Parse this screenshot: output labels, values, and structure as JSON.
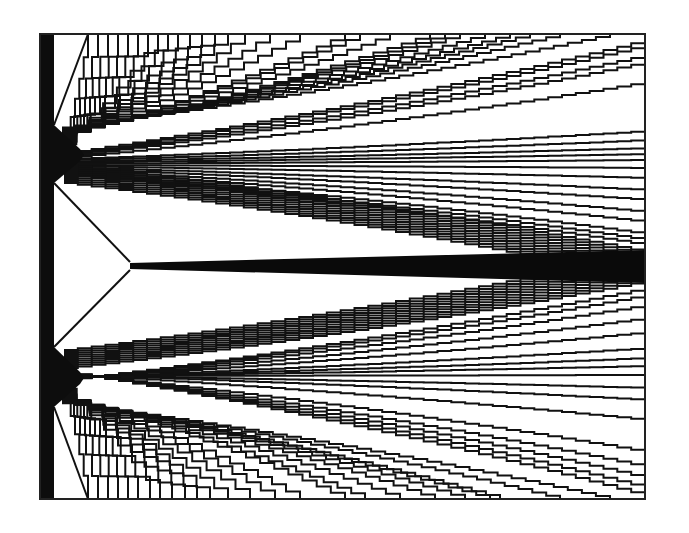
{
  "figure": {
    "type": "streamline-diagram",
    "frame": {
      "x0": 40,
      "y0": 34,
      "x1": 645,
      "y1": 499
    },
    "left_boundary": {
      "x": 40,
      "width": 14,
      "color": "#0d0d0d"
    },
    "line_color": "#111111",
    "background": "#ffffff",
    "sources": [
      {
        "name": "upper",
        "x": 54,
        "y": 155,
        "spread": [
          125,
          183
        ]
      },
      {
        "name": "lower",
        "x": 54,
        "y": 378,
        "spread": [
          347,
          407
        ]
      }
    ],
    "central_band": {
      "start": [
        130,
        266
      ],
      "end_top": [
        645,
        250
      ],
      "end_bottom": [
        645,
        283
      ]
    },
    "upper_top_exits_x": [
      88,
      98,
      108,
      118,
      128,
      138,
      148,
      158,
      168,
      178,
      190,
      202,
      215,
      228,
      245,
      270,
      300,
      345,
      360,
      390,
      430,
      445,
      460,
      485,
      510,
      530,
      560,
      610
    ],
    "upper_right_exits_y": [
      40,
      45,
      55,
      62,
      82,
      131,
      140,
      148,
      154,
      160,
      168,
      178,
      190,
      200,
      212,
      222,
      234,
      240,
      245
    ],
    "lower_bottom_exits_x": [
      88,
      98,
      108,
      118,
      128,
      138,
      150,
      160,
      172,
      185,
      197,
      210,
      228,
      250,
      275,
      300,
      345,
      365,
      400,
      435,
      465,
      490,
      500,
      560,
      610
    ],
    "lower_right_exits_y": [
      288,
      295,
      305,
      318,
      332,
      348,
      358,
      366,
      375,
      388,
      400,
      420,
      452,
      467,
      478,
      488,
      496
    ]
  }
}
